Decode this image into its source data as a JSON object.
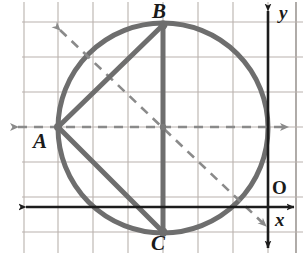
{
  "figure": {
    "width": 303,
    "height": 253,
    "background": "#ffffff"
  },
  "colors": {
    "grid": "#b9b2ad",
    "grid_border": "#8e8884",
    "circle": "#6e6e6e",
    "chord": "#6e6e6e",
    "dashed": "#8a8a8a",
    "axis": "#1c1c1c",
    "label": "#1a1a1a"
  },
  "grid": {
    "cell_size": 35,
    "x_lines": [
      24,
      58,
      93,
      128,
      163,
      198,
      233,
      268,
      296
    ],
    "y_lines": [
      22,
      57,
      92,
      127,
      162,
      197,
      232
    ]
  },
  "axes": {
    "x_axis": {
      "label": "x",
      "y": 207,
      "x_start": 23,
      "x_end": 296,
      "arrows": "both"
    },
    "y_axis": {
      "label": "y",
      "x": 268,
      "y_start": 8,
      "y_end": 250,
      "arrows": "both"
    },
    "origin": {
      "label": "O",
      "x": 268,
      "y": 207
    }
  },
  "circle": {
    "center_x": 163,
    "center_y": 128,
    "radius": 105,
    "stroke_width": 5
  },
  "points": [
    {
      "label": "A",
      "x": 58,
      "y": 127,
      "label_x": 33,
      "label_y": 131
    },
    {
      "label": "B",
      "x": 163,
      "y": 25,
      "label_x": 152,
      "label_y": 1
    },
    {
      "label": "C",
      "x": 163,
      "y": 232,
      "label_x": 151,
      "label_y": 233
    }
  ],
  "chords": [
    {
      "name": "segment-AB",
      "x1": 58,
      "y1": 127,
      "x2": 163,
      "y2": 25
    },
    {
      "name": "segment-AC",
      "x1": 58,
      "y1": 127,
      "x2": 163,
      "y2": 232
    },
    {
      "name": "segment-BC",
      "x1": 163,
      "y1": 25,
      "x2": 163,
      "y2": 232
    }
  ],
  "dashed_lines": [
    {
      "name": "horizontal-dashed-line",
      "x1": 13,
      "y1": 127,
      "x2": 292,
      "y2": 127,
      "arrows": "both"
    },
    {
      "name": "diagonal-dashed-line",
      "x1": 56,
      "y1": 25,
      "x2": 270,
      "y2": 230,
      "arrows": "both"
    }
  ],
  "marks": [
    {
      "name": "center-dot",
      "x": 163,
      "y": 127
    }
  ]
}
